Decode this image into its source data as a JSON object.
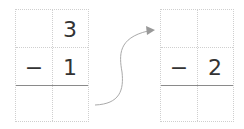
{
  "left_grid": {
    "top": "3",
    "minus": "−",
    "bottom": "1"
  },
  "right_grid": {
    "top": "",
    "minus": "−",
    "bottom": "2"
  },
  "colors": {
    "grid": "#cfcfcf",
    "rule": "#8a8a8a",
    "arrow": "#999999",
    "text": "#333333"
  }
}
